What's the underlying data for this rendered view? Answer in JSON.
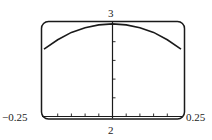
{
  "chart_data": {
    "type": "line",
    "title": "",
    "xlabel": "",
    "ylabel": "",
    "xlim": [
      -0.25,
      0.25
    ],
    "ylim": [
      2,
      3
    ],
    "x_tick_step": 0.05,
    "y_tick_step": 0.2,
    "grid": false,
    "legend": null,
    "labels": {
      "x_min": "−0.25",
      "x_max": "0.25",
      "y_max": "3",
      "y_min": "2"
    },
    "series": [
      {
        "name": "f(x)",
        "x": [
          -0.25,
          -0.2,
          -0.15,
          -0.1,
          -0.05,
          0,
          0.05,
          0.1,
          0.15,
          0.2,
          0.25
        ],
        "values": [
          2.72,
          2.82,
          2.9,
          2.95,
          2.98,
          2.99,
          2.98,
          2.95,
          2.9,
          2.82,
          2.72
        ]
      }
    ]
  },
  "colors": {
    "frame": "#1a1a1a",
    "curve": "#1a1a1a",
    "background": "#ffffff"
  }
}
